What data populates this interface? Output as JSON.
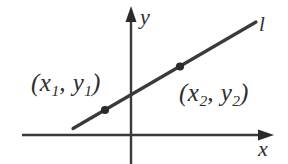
{
  "figure": {
    "type": "coordinate-plane-line-diagram",
    "background_color": "#ffffff",
    "ink_color": "#3a3a3a",
    "text_color": "#2e2e2e"
  },
  "axes": {
    "x_axis": {
      "label": "x",
      "arrow_direction": "right",
      "start": [
        22,
        135
      ],
      "end": [
        272,
        135
      ]
    },
    "y_axis": {
      "label": "y",
      "arrow_direction": "up",
      "start": [
        131,
        164
      ],
      "end": [
        131,
        10
      ]
    },
    "origin": [
      131,
      135
    ]
  },
  "line": {
    "label": "l",
    "start": [
      73,
      128
    ],
    "end": [
      256,
      22
    ]
  },
  "points": [
    {
      "label": "(x",
      "sub1": "1",
      "mid": ", y",
      "sub2": "1",
      "close": ")",
      "marker": [
        105,
        107
      ]
    },
    {
      "label": "(x",
      "sub1": "2",
      "mid": ", y",
      "sub2": "2",
      "close": ")",
      "marker": [
        180,
        68
      ]
    }
  ],
  "labels": {
    "point1_open": "(x",
    "point1_sub1": "1",
    "point1_mid": ", y",
    "point1_sub2": "1",
    "point1_close": ")",
    "point2_open": "(x",
    "point2_sub1": "2",
    "point2_mid": ", y",
    "point2_sub2": "2",
    "point2_close": ")",
    "x_axis": "x",
    "y_axis": "y",
    "line": "l"
  }
}
